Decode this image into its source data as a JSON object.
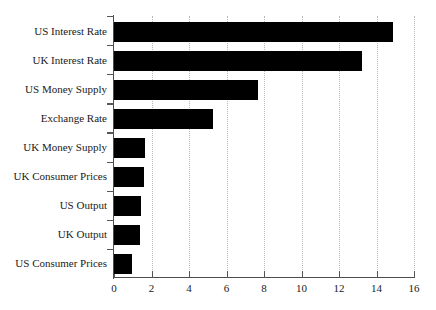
{
  "chart_data": {
    "type": "bar",
    "orientation": "horizontal",
    "title": "",
    "xlabel": "",
    "ylabel": "",
    "xlim": [
      0,
      16
    ],
    "xticks": [
      0,
      2,
      4,
      6,
      8,
      10,
      12,
      14,
      16
    ],
    "xtick_labels": [
      "0",
      "2",
      "4",
      "6",
      "8",
      "10",
      "12",
      "14",
      "16"
    ],
    "grid": "vertical-dotted",
    "legend": "none",
    "bar_color": "#000000",
    "axis_color": "#4d4d4d",
    "gridline_color": "#b9b9b9",
    "categories": [
      "US Interest Rate",
      "UK Interest Rate",
      "US Money Supply",
      "Exchange Rate",
      "UK Money Supply",
      "UK Consumer Prices",
      "US Output",
      "UK Output",
      "US Consumer Prices"
    ],
    "values": [
      14.9,
      13.2,
      7.7,
      5.3,
      1.65,
      1.6,
      1.45,
      1.4,
      0.95
    ]
  }
}
